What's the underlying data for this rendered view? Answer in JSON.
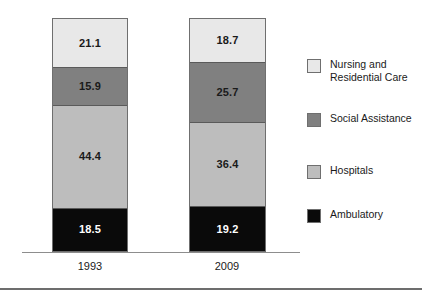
{
  "chart_data": {
    "type": "bar",
    "subtype": "stacked-bar",
    "title": "",
    "xlabel": "",
    "ylabel": "",
    "ylim": [
      0,
      100
    ],
    "grid": false,
    "legend_position": "right",
    "categories": [
      "1993",
      "2009"
    ],
    "series": [
      {
        "name": "Ambulatory",
        "color": "#0a0a0a",
        "text_color": "#ffffff",
        "values": [
          18.5,
          19.2
        ],
        "labels": [
          "18.5",
          "19.2"
        ]
      },
      {
        "name": "Hospitals",
        "color": "#bdbdbd",
        "text_color": "#1a1a1a",
        "values": [
          44.4,
          36.4
        ],
        "labels": [
          "44.4",
          "36.4"
        ]
      },
      {
        "name": "Social Assistance",
        "color": "#808080",
        "text_color": "#1a1a1a",
        "values": [
          15.9,
          25.7
        ],
        "labels": [
          "15.9",
          "25.7"
        ]
      },
      {
        "name": "Nursing and Residential Care",
        "color": "#e8e8e8",
        "text_color": "#1a1a1a",
        "values": [
          21.1,
          18.7
        ],
        "labels": [
          "21.1",
          "18.7"
        ]
      }
    ],
    "stack_order_top_to_bottom": [
      "Nursing and Residential Care",
      "Social Assistance",
      "Hospitals",
      "Ambulatory"
    ]
  },
  "bars": [
    {
      "category": "1993",
      "segments": [
        {
          "name": "Nursing and Residential Care",
          "label": "21.1",
          "value": 21.1,
          "color": "#e8e8e8",
          "text_color": "#1a1a1a"
        },
        {
          "name": "Social Assistance",
          "label": "15.9",
          "value": 15.9,
          "color": "#808080",
          "text_color": "#1a1a1a"
        },
        {
          "name": "Hospitals",
          "label": "44.4",
          "value": 44.4,
          "color": "#bdbdbd",
          "text_color": "#1a1a1a"
        },
        {
          "name": "Ambulatory",
          "label": "18.5",
          "value": 18.5,
          "color": "#0a0a0a",
          "text_color": "#ffffff"
        }
      ]
    },
    {
      "category": "2009",
      "segments": [
        {
          "name": "Nursing and Residential Care",
          "label": "18.7",
          "value": 18.7,
          "color": "#e8e8e8",
          "text_color": "#1a1a1a"
        },
        {
          "name": "Social Assistance",
          "label": "25.7",
          "value": 25.7,
          "color": "#808080",
          "text_color": "#1a1a1a"
        },
        {
          "name": "Hospitals",
          "label": "36.4",
          "value": 36.4,
          "color": "#bdbdbd",
          "text_color": "#1a1a1a"
        },
        {
          "name": "Ambulatory",
          "label": "19.2",
          "value": 19.2,
          "color": "#0a0a0a",
          "text_color": "#ffffff"
        }
      ]
    }
  ],
  "tick_labels": [
    "1993",
    "2009"
  ],
  "legend": {
    "items": [
      {
        "label": "Nursing and\nResidential Care",
        "color": "#e8e8e8"
      },
      {
        "label": "Social Assistance",
        "color": "#808080"
      },
      {
        "label": "Hospitals",
        "color": "#bdbdbd"
      },
      {
        "label": "Ambulatory",
        "color": "#0a0a0a"
      }
    ]
  },
  "colors": {
    "nursing_and_residential_care": "#e8e8e8",
    "social_assistance": "#808080",
    "hospitals": "#bdbdbd",
    "ambulatory": "#0a0a0a",
    "axis": "#8d8d8d",
    "rule": "#6d6d6d",
    "text": "#1a1a1a"
  }
}
